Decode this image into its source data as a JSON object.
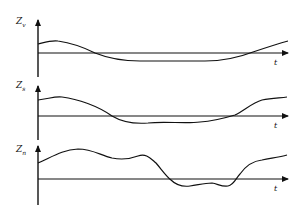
{
  "figure": {
    "panels": [
      {
        "y_label": "Z",
        "y_sub": "v",
        "x_label": "t"
      },
      {
        "y_label": "Z",
        "y_sub": "s",
        "x_label": "t"
      },
      {
        "y_label": "Z",
        "y_sub": "n",
        "x_label": "t"
      }
    ],
    "colors": {
      "line": "#111111",
      "background": "#ffffff"
    }
  }
}
